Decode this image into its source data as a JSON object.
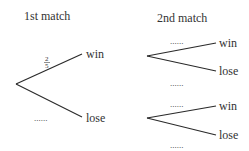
{
  "diagram": {
    "type": "probability-tree",
    "headers": {
      "first": "1st match",
      "second": "2nd match"
    },
    "first_stage": {
      "win_label": "win",
      "lose_label": "lose",
      "win_prob_numerator": "2",
      "win_prob_denominator": "5",
      "lose_prob": "......"
    },
    "second_stage": {
      "after_win": {
        "win_label": "win",
        "lose_label": "lose",
        "win_prob": "......",
        "lose_prob": "......"
      },
      "after_lose": {
        "win_label": "win",
        "lose_label": "lose",
        "win_prob": "......",
        "lose_prob": "......"
      }
    }
  }
}
